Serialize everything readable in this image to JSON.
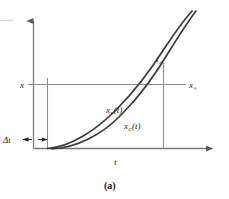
{
  "figure": {
    "caption": "(a)",
    "axes": {
      "x_axis_label": "t",
      "y_axis_label": "x"
    },
    "annotations": {
      "delta_t": "Δt",
      "t_infinity_base": "t",
      "t_infinity_sub": "∞",
      "x_infinity_base": "x",
      "x_infinity_sub": "∞"
    },
    "curves": [
      {
        "id": "xv",
        "base": "x",
        "sub": "V",
        "arg": "(t)",
        "label": "x_V(t)",
        "color": "#3b3b3b"
      },
      {
        "id": "xc",
        "base": "x",
        "sub": "C",
        "arg": "(t)",
        "label": "x_C(t)",
        "color": "#3b3b3b"
      }
    ],
    "colors": {
      "axis": "#7a7a7a",
      "guide": "#8c8c8c",
      "curve": "#3b3b3b",
      "text": "#1a1a1a",
      "background": "#ffffff",
      "margin_rule": "#d8d8d8"
    }
  }
}
